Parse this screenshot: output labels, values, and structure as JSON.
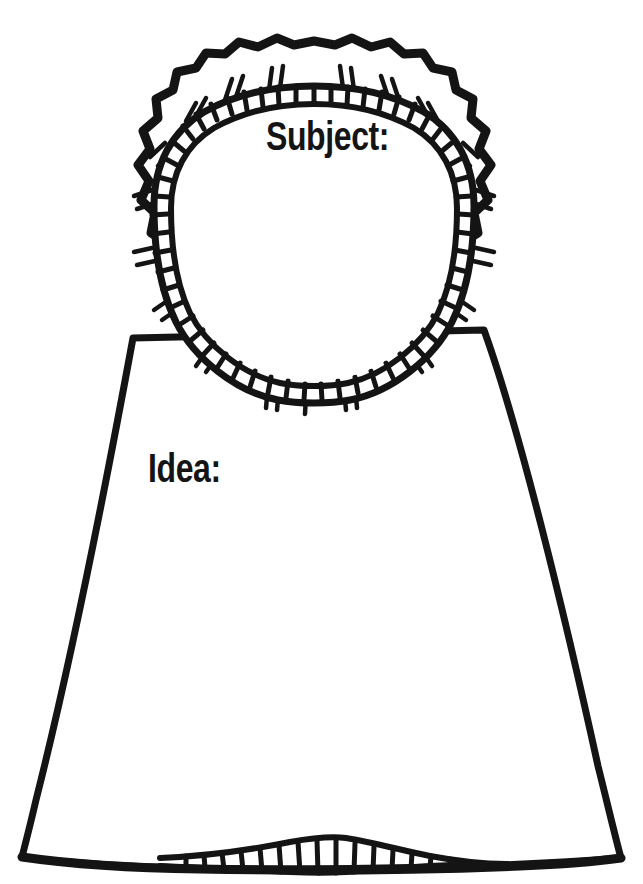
{
  "page": {
    "width": 643,
    "height": 884,
    "background_color": "#ffffff",
    "ink_color": "#141414",
    "style": "black-and-white hand-drawn line art coloring-page template"
  },
  "artwork": {
    "name": "award-ribbon",
    "description": "Hand-drawn prize rosette ribbon with a scalloped ruffled outer edge, a braided inner ring band, an empty circular center, and a wide tapering ribbon tail below.",
    "parts": [
      {
        "name": "rosette-outer-ruffle",
        "shape": "scalloped-ring",
        "center_x": 314,
        "center_y": 239,
        "outer_radius": 198,
        "inner_radius": 158,
        "scallop_count": 18,
        "tick_marks": true
      },
      {
        "name": "rosette-braid-ring",
        "shape": "ladder-hatched-ring",
        "center_x": 314,
        "center_y": 243,
        "outer_radius": 157,
        "inner_radius": 140,
        "rung_count": 56
      },
      {
        "name": "rosette-center",
        "shape": "circle",
        "center_x": 314,
        "center_y": 243,
        "radius": 139,
        "fill": "#ffffff"
      },
      {
        "name": "ribbon-tail",
        "shape": "tapered-trapezoid",
        "top_left_x": 133,
        "top_left_y": 338,
        "top_right_x": 484,
        "top_right_y": 330,
        "bottom_left_x": 22,
        "bottom_left_y": 858,
        "bottom_right_x": 621,
        "bottom_right_y": 860
      },
      {
        "name": "ribbon-tail-fold",
        "shape": "ladder-hatched-fold",
        "start_x": 160,
        "end_x": 500,
        "baseline_y": 862,
        "rung_count": 14
      }
    ]
  },
  "fields": {
    "subject": {
      "label": "Subject:",
      "value": "",
      "placeholder": "",
      "x": 266,
      "y": 116
    },
    "idea": {
      "label": "Idea:",
      "value": "",
      "placeholder": "",
      "x": 148,
      "y": 448
    }
  }
}
